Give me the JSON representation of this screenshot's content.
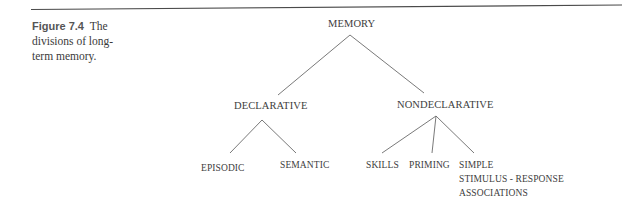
{
  "caption": {
    "label": "Figure 7.4",
    "text": "The divisions of long-term memory.",
    "line1": "The",
    "line2": "divisions of long-",
    "line3": "term memory."
  },
  "tree": {
    "root": {
      "label": "MEMORY",
      "children": [
        {
          "label": "DECLARATIVE",
          "children": [
            {
              "label": "EPISODIC"
            },
            {
              "label": "SEMANTIC"
            }
          ]
        },
        {
          "label": "NONDECLARATIVE",
          "children": [
            {
              "label": "SKILLS"
            },
            {
              "label": "PRIMING"
            },
            {
              "label": "SIMPLE STIMULUS - RESPONSE ASSOCIATIONS",
              "lines": [
                "SIMPLE",
                "STIMULUS - RESPONSE",
                "ASSOCIATIONS"
              ]
            }
          ]
        }
      ]
    }
  },
  "colors": {
    "rule": "#4a4a4a",
    "lines": "#6a6a6a",
    "text": "#3d3d3d"
  }
}
